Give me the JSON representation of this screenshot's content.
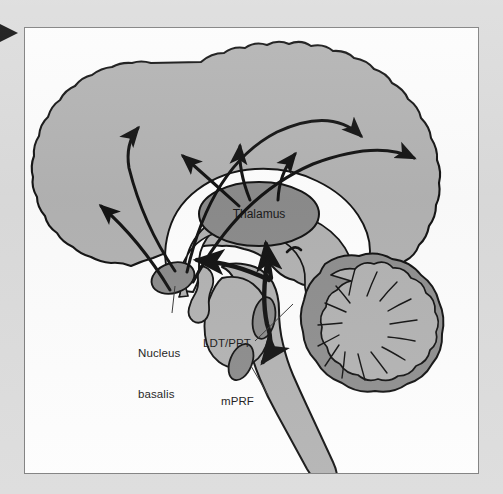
{
  "figure": {
    "type": "anatomical-diagram",
    "page_background_color": "#dcdcdc",
    "panel_background_color": "#fdfdfd",
    "panel_border_color": "#7e7e7e",
    "corner_marker": {
      "name": "left-edge-triangle-marker",
      "shape": "right-pointing-triangle",
      "color": "#111111"
    },
    "palette": {
      "gray_matter": "#b3b3b3",
      "nucleus_fill": "#8c8c8c",
      "cerebellum_cortex": "#8f8f8f",
      "cerebellum_inner": "#b3b3b3",
      "white_matter": "#ffffff",
      "outline": "#141414",
      "arrow": "#141414",
      "leader_line": "#3a3a3a",
      "text": "#1a1a1a"
    },
    "labels": [
      {
        "id": "thalamus",
        "text": "Thalamus",
        "placement": "inside-structure",
        "structure": "thalamus-ellipse"
      },
      {
        "id": "nucleus-basalis",
        "text": "Nucleus\nbasalis",
        "line1": "Nucleus",
        "line2": "basalis",
        "placement": "outside-with-leader",
        "structure": "nucleus-basalis-ellipse"
      },
      {
        "id": "ldt-ppt",
        "text": "LDT/PPT",
        "placement": "outside-with-leader",
        "structure": "ldt-ppt-ellipse"
      },
      {
        "id": "mprf",
        "text": "mPRF",
        "placement": "outside-with-leader",
        "structure": "mprf-ellipse"
      }
    ],
    "structures": [
      "cerebral-cortex",
      "corpus-callosum",
      "thalamus",
      "nucleus-basalis",
      "ldt-ppt",
      "mprf",
      "cerebellum",
      "brainstem",
      "spinal-cord"
    ],
    "pathways": [
      {
        "id": "cortical-projection-1",
        "from": "thalamus",
        "to": "frontal-cortex",
        "direction": "ascending",
        "arrowheads": 1
      },
      {
        "id": "cortical-projection-2",
        "from": "thalamus",
        "to": "dorsal-cortex",
        "direction": "ascending",
        "arrowheads": 1
      },
      {
        "id": "cortical-projection-3",
        "from": "thalamus",
        "to": "parietal-cortex",
        "direction": "ascending",
        "arrowheads": 1
      },
      {
        "id": "basalis-projection-anterior",
        "from": "nucleus-basalis",
        "to": "frontal-cortex",
        "direction": "ascending",
        "arrowheads": 1
      },
      {
        "id": "basalis-projection-posterior",
        "from": "nucleus-basalis",
        "to": "occipital-cortex",
        "direction": "ascending",
        "arrowheads": 1
      },
      {
        "id": "basalis-projection-lateral",
        "from": "nucleus-basalis",
        "to": "temporal-cortex",
        "direction": "lateral",
        "arrowheads": 1
      },
      {
        "id": "brainstem-to-thalamus",
        "from": "ldt-ppt",
        "to": "thalamus",
        "direction": "ascending",
        "arrowheads": 1
      },
      {
        "id": "brainstem-to-basalis",
        "from": "ldt-ppt",
        "to": "nucleus-basalis",
        "direction": "ascending",
        "arrowheads": 1
      },
      {
        "id": "descending-to-mprf",
        "from": "ldt-ppt",
        "to": "mprf",
        "direction": "descending",
        "arrowheads": 1
      }
    ]
  }
}
